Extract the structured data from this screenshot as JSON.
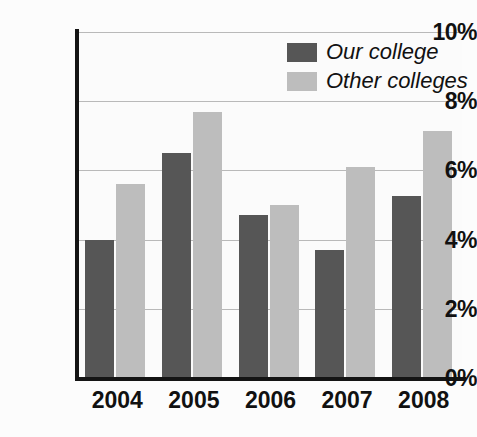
{
  "chart_data": {
    "type": "bar",
    "title": "",
    "subtitle": "",
    "xlabel": "",
    "ylabel": "",
    "categories": [
      "2004",
      "2005",
      "2006",
      "2007",
      "2008"
    ],
    "series": [
      {
        "name": "Our college",
        "color": "#565656",
        "values": [
          4.0,
          6.5,
          4.7,
          3.7,
          5.25
        ]
      },
      {
        "name": "Other colleges",
        "color": "#bdbdbd",
        "values": [
          5.6,
          7.7,
          5.0,
          6.1,
          7.15
        ]
      }
    ],
    "ylim": [
      0,
      10
    ],
    "ytick_values": [
      10,
      8,
      6,
      4,
      2,
      0
    ],
    "ytick_labels": [
      "10%",
      "8%",
      "6%",
      "4%",
      "2%",
      "0%"
    ],
    "value_unit": "%",
    "grid": true,
    "grid_axis": "y",
    "legend_position": "top-right",
    "annotations": []
  },
  "legend": {
    "entries": [
      {
        "label": "Our college",
        "swatch_name": "legend-swatch-our-college"
      },
      {
        "label": "Other colleges",
        "swatch_name": "legend-swatch-other-colleges"
      }
    ]
  },
  "colors": {
    "series_our_college": "#565656",
    "series_other_colleges": "#bdbdbd",
    "axis": "#141414",
    "gridline": "#b9b9b9",
    "text": "#111111",
    "background": "#fcfcfc"
  }
}
